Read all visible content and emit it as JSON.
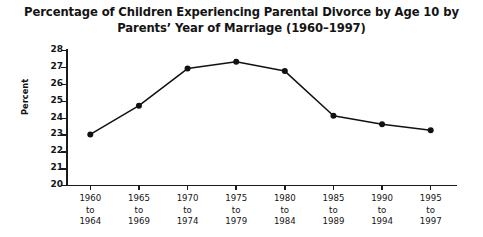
{
  "chart_data": {
    "type": "line",
    "title_lines": [
      "Percentage of Children Experiencing Parental Divorce by Age 10 by",
      "Parents’ Year of Marriage (1960–1997)"
    ],
    "xlabel": "",
    "ylabel": "Percent",
    "ylim": [
      20,
      28
    ],
    "ytick_labels": [
      "20",
      "21",
      "22",
      "23",
      "24",
      "25",
      "26",
      "27",
      "28"
    ],
    "ytick_values": [
      20,
      21,
      22,
      23,
      24,
      25,
      26,
      27,
      28
    ],
    "grid": false,
    "legend": false,
    "categories": [
      "1960 to 1964",
      "1965 to 1969",
      "1970 to 1974",
      "1975 to 1979",
      "1980 to 1984",
      "1985 to 1989",
      "1990 to 1994",
      "1995 to 1997"
    ],
    "category_lines": [
      [
        "1960",
        "to",
        "1964"
      ],
      [
        "1965",
        "to",
        "1969"
      ],
      [
        "1970",
        "to",
        "1974"
      ],
      [
        "1975",
        "to",
        "1979"
      ],
      [
        "1980",
        "to",
        "1984"
      ],
      [
        "1985",
        "to",
        "1989"
      ],
      [
        "1990",
        "to",
        "1994"
      ],
      [
        "1995",
        "to",
        "1997"
      ]
    ],
    "values": [
      23.0,
      24.7,
      26.9,
      27.3,
      26.75,
      24.1,
      23.6,
      23.25
    ],
    "series": [
      {
        "name": "Percent experiencing parental divorce by age 10",
        "values": [
          23.0,
          24.7,
          26.9,
          27.3,
          26.75,
          24.1,
          23.6,
          23.25
        ]
      }
    ],
    "line_color": "#111111",
    "marker_color": "#111111",
    "marker": "circle"
  }
}
